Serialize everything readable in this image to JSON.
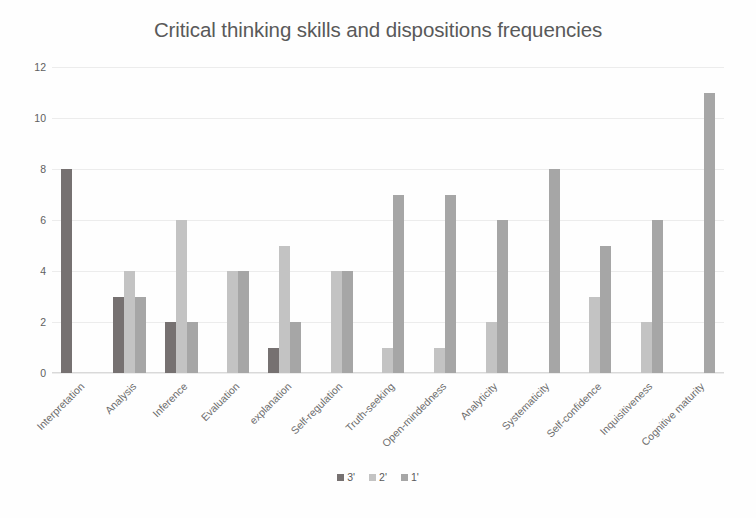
{
  "chart_data": {
    "type": "bar",
    "title": "Critical thinking skills and dispositions frequencies",
    "xlabel": "",
    "ylabel": "",
    "ylim": [
      0,
      12
    ],
    "yticks": [
      0,
      2,
      4,
      6,
      8,
      10,
      12
    ],
    "grid": true,
    "legend_position": "bottom",
    "grouping": "grouped",
    "categories": [
      "Interpretation",
      "Analysis",
      "Inference",
      "Evaluation",
      "explanation",
      "Self-regulation",
      "Truth-seeking",
      "Open-mindedness",
      "Analyticity",
      "Systematicity",
      "Self-confidence",
      "Inquisitiveness",
      "Cognitive maturity"
    ],
    "series": [
      {
        "name": "3'",
        "color": "#767171",
        "values": [
          8,
          3,
          2,
          0,
          1,
          0,
          0,
          0,
          0,
          0,
          0,
          0,
          0
        ]
      },
      {
        "name": "2'",
        "color": "#c3c3c3",
        "values": [
          0,
          4,
          6,
          4,
          5,
          4,
          1,
          1,
          2,
          0,
          3,
          2,
          0
        ]
      },
      {
        "name": "1'",
        "color": "#a6a6a6",
        "values": [
          0,
          3,
          2,
          4,
          2,
          4,
          7,
          7,
          6,
          8,
          5,
          6,
          11
        ]
      }
    ]
  },
  "legend": {
    "items": [
      {
        "label": "3'"
      },
      {
        "label": "2'"
      },
      {
        "label": "1'"
      }
    ]
  }
}
